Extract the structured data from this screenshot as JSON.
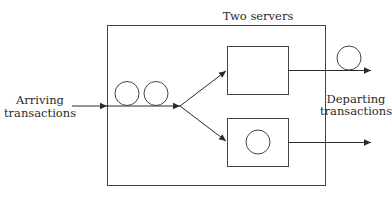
{
  "diagram": {
    "type": "queueing-system",
    "labels": {
      "system": "Two servers",
      "arrival_line1": "Arriving",
      "arrival_line2": "transactions",
      "departure_line1": "Departing",
      "departure_line2": "transactions"
    },
    "queue": {
      "waiting_transactions": 2
    },
    "servers": [
      {
        "id": "server-1",
        "busy": false
      },
      {
        "id": "server-2",
        "busy": true
      }
    ],
    "departures": [
      {
        "from": "server-1",
        "transaction_shown": true
      },
      {
        "from": "server-2",
        "transaction_shown": false
      }
    ],
    "colors": {
      "stroke": "#3a3a3a",
      "text": "#2a2a2a",
      "background": "#ffffff"
    }
  }
}
